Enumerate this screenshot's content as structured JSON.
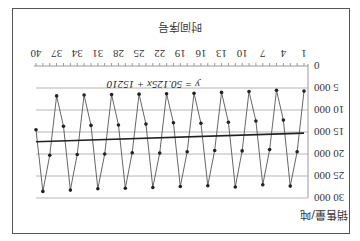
{
  "chart_data": {
    "type": "line",
    "title": "",
    "xlabel": "时间序号",
    "ylabel": "销售量/吨",
    "x_tick_labels": [
      "1",
      "4",
      "7",
      "10",
      "13",
      "16",
      "19",
      "22",
      "25",
      "28",
      "31",
      "34",
      "37",
      "40"
    ],
    "y_tick_labels": [
      "0",
      "5 000",
      "10 000",
      "15 000",
      "20 000",
      "25 000",
      "30 000"
    ],
    "ylim": [
      0,
      30000
    ],
    "xlim": [
      1,
      40
    ],
    "grid": "horizontal",
    "orientation_note": "figure rendered rotated 180 degrees",
    "x": [
      1,
      2,
      3,
      4,
      5,
      6,
      7,
      8,
      9,
      10,
      11,
      12,
      13,
      14,
      15,
      16,
      17,
      18,
      19,
      20,
      21,
      22,
      23,
      24,
      25,
      26,
      27,
      28,
      29,
      30,
      31,
      32,
      33,
      34,
      35,
      36,
      37,
      38,
      39,
      40
    ],
    "series": [
      {
        "name": "销售量",
        "values": [
          5700,
          19500,
          27300,
          12300,
          5500,
          19000,
          27000,
          12500,
          5800,
          19300,
          27500,
          12800,
          6000,
          19200,
          27200,
          13000,
          6200,
          19500,
          27400,
          12900,
          6300,
          19800,
          27600,
          13200,
          6400,
          19700,
          27800,
          13400,
          6500,
          20000,
          27900,
          13500,
          6600,
          20100,
          28200,
          13700,
          6800,
          20300,
          28500,
          14500
        ]
      },
      {
        "name": "线性趋势",
        "equation": "y = 50.125x + 15210",
        "slope": 50.125,
        "intercept": 15210
      }
    ]
  },
  "labels": {
    "equation": "y = 50.125x + 15210",
    "xlabel": "时间序号",
    "ylabel": "销售量/吨"
  }
}
